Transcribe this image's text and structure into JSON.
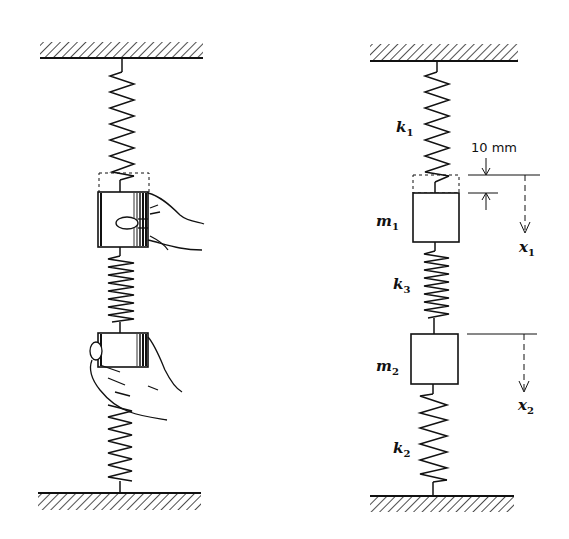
{
  "diagram": {
    "type": "two-mass spring system",
    "left_figure": {
      "description": "Hands displacing masses on a three-spring, two-mass vertical system",
      "elements": [
        "ceiling",
        "upper-spring",
        "mass-1-held-by-hand",
        "middle-spring",
        "mass-2-held-by-hand",
        "lower-spring",
        "floor"
      ]
    },
    "right_figure": {
      "springs": [
        {
          "id": "k1",
          "label": "k",
          "sub": "1"
        },
        {
          "id": "k3",
          "label": "k",
          "sub": "3"
        },
        {
          "id": "k2",
          "label": "k",
          "sub": "2"
        }
      ],
      "masses": [
        {
          "id": "m1",
          "label": "m",
          "sub": "1"
        },
        {
          "id": "m2",
          "label": "m",
          "sub": "2"
        }
      ],
      "displacements": [
        {
          "id": "x1",
          "label": "x",
          "sub": "1"
        },
        {
          "id": "x2",
          "label": "x",
          "sub": "2"
        }
      ],
      "dimension": {
        "value": "10 mm"
      }
    },
    "colors": {
      "ink": "#111111",
      "background": "#ffffff"
    }
  }
}
